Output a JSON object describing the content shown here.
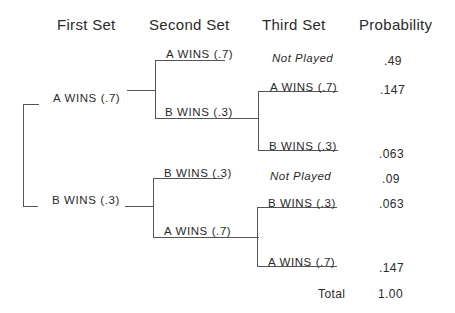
{
  "headers": {
    "first_set": "First Set",
    "second_set": "Second Set",
    "third_set": "Third Set",
    "probability": "Probability"
  },
  "first_set": {
    "a": "A WINS (.7)",
    "b": "B WINS (.3)"
  },
  "second_set": {
    "after_a": {
      "a": "A WINS (.7)",
      "b": "B WINS (.3)"
    },
    "after_b": {
      "b": "B WINS (.3)",
      "a": "A WINS (.7)"
    }
  },
  "third_set": {
    "aa": "Not Played",
    "ab": {
      "a": "A WINS (.7)",
      "b": "B WINS (.3)"
    },
    "bb": "Not Played",
    "ba": {
      "b": "B WINS (.3)",
      "a": "A WINS (.7)"
    }
  },
  "probabilities": [
    ".49",
    ".147",
    ".063",
    ".09",
    ".063",
    ".147"
  ],
  "total_label": "Total",
  "total_value": "1.00"
}
